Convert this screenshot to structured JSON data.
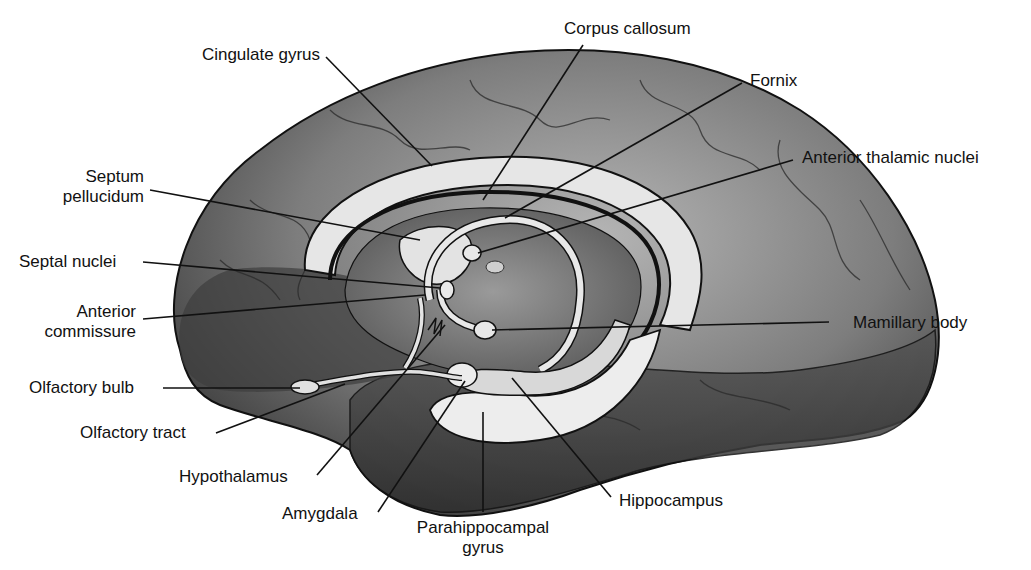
{
  "figure": {
    "colors": {
      "background": "#ffffff",
      "cortex_dark": "#4a4a4a",
      "cortex_mid": "#8a8a8a",
      "cortex_light": "#c8c8c8",
      "limbic_highlight": "#e8e8e8",
      "outline": "#111111",
      "label_text": "#111111"
    }
  },
  "labels": {
    "cingulate_gyrus": "Cingulate gyrus",
    "corpus_callosum": "Corpus callosum",
    "fornix": "Fornix",
    "anterior_thalamic_nuclei": "Anterior thalamic nuclei",
    "septum_pellucidum_1": "Septum",
    "septum_pellucidum_2": "pellucidum",
    "septal_nuclei": "Septal nuclei",
    "anterior_commissure_1": "Anterior",
    "anterior_commissure_2": "commissure",
    "mamillary_body": "Mamillary body",
    "olfactory_bulb": "Olfactory bulb",
    "olfactory_tract": "Olfactory tract",
    "hypothalamus": "Hypothalamus",
    "amygdala": "Amygdala",
    "parahippocampal_gyrus_1": "Parahippocampal",
    "parahippocampal_gyrus_2": "gyrus",
    "hippocampus": "Hippocampus"
  }
}
